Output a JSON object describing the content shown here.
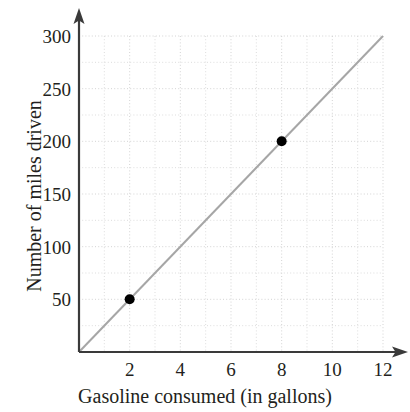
{
  "chart_data": {
    "type": "scatter",
    "title": "",
    "subtitle": "",
    "xlabel": "Gasoline consumed (in gallons)",
    "ylabel": "Number of miles driven",
    "xlim": [
      0,
      12
    ],
    "ylim": [
      0,
      300
    ],
    "xticks": [
      2,
      4,
      6,
      8,
      10,
      12
    ],
    "yticks": [
      50,
      100,
      150,
      200,
      250,
      300
    ],
    "xtick_labels": [
      "2",
      "4",
      "6",
      "8",
      "10",
      "12"
    ],
    "ytick_labels": [
      "50",
      "100",
      "150",
      "200",
      "250",
      "300"
    ],
    "x_minor_step": 1,
    "y_minor_step": 25,
    "grid": true,
    "grid_style": "dotted",
    "grid_color": "#cfcfcf",
    "legend": null,
    "legend_position": "none",
    "axis_color": "#3a3a3a",
    "points": [
      {
        "x": 2,
        "y": 50,
        "label": "(2, 50)"
      },
      {
        "x": 8,
        "y": 200,
        "label": "(8, 200)"
      }
    ],
    "point_color": "#000000",
    "point_radius": 5,
    "series": [
      {
        "name": "trend line",
        "type": "line",
        "color": "#a6a6a6",
        "slope": 25,
        "intercept": 0,
        "x": [
          0,
          12
        ],
        "values": [
          0,
          300
        ]
      }
    ],
    "annotations": []
  },
  "axis_titles": {
    "x": "Gasoline consumed (in gallons)",
    "y": "Number of miles driven"
  },
  "icons": {
    "y_axis_arrow": "arrow-up-icon",
    "x_axis_arrow": "arrow-right-icon"
  }
}
